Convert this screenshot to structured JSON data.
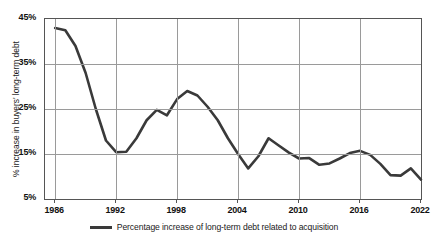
{
  "chart_data": {
    "type": "line",
    "title": "",
    "xlabel": "",
    "ylabel": "% increase in buyers' long-term debt",
    "xlim": [
      1985,
      2022
    ],
    "ylim": [
      5,
      45
    ],
    "ytick_labels": [
      "45%",
      "35%",
      "25%",
      "15%",
      "5%"
    ],
    "ytick_values": [
      45,
      35,
      25,
      15,
      5
    ],
    "xtick_labels": [
      "1986",
      "1992",
      "1998",
      "2004",
      "2010",
      "2016",
      "2022"
    ],
    "xtick_values": [
      1986,
      1992,
      1998,
      2004,
      2010,
      2016,
      2022
    ],
    "grid": "both",
    "legend_position": "bottom-center",
    "line_color": "#3a3a3a",
    "grid_color": "#9a9a9a",
    "frame_color": "#555555",
    "series": [
      {
        "name": "Percentage increase of long-term debt related to acquisition",
        "x": [
          1986,
          1987,
          1988,
          1989,
          1990,
          1991,
          1992,
          1993,
          1994,
          1995,
          1996,
          1997,
          1998,
          1999,
          2000,
          2001,
          2002,
          2003,
          2004,
          2005,
          2006,
          2007,
          2008,
          2009,
          2010,
          2011,
          2012,
          2013,
          2014,
          2015,
          2016,
          2017,
          2018,
          2019,
          2020,
          2021,
          2022
        ],
        "values": [
          43.0,
          42.5,
          39.0,
          33.0,
          25.0,
          18.0,
          15.4,
          15.5,
          18.5,
          22.5,
          24.8,
          23.6,
          27.2,
          29.0,
          28.0,
          25.5,
          22.5,
          18.5,
          15.0,
          11.8,
          14.5,
          18.5,
          16.9,
          15.3,
          14.0,
          14.1,
          12.6,
          12.9,
          14.0,
          15.2,
          15.7,
          14.8,
          12.8,
          10.3,
          10.2,
          11.8,
          9.3
        ]
      }
    ]
  },
  "legend": {
    "label": "Percentage increase of long-term debt related to acquisition"
  }
}
